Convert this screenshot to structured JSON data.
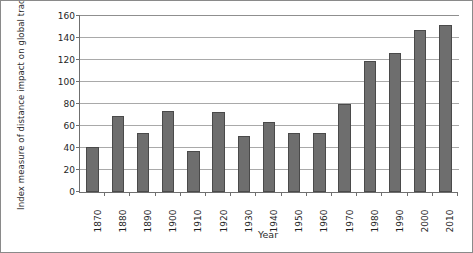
{
  "chart_data": {
    "type": "bar",
    "title": "",
    "xlabel": "Year",
    "ylabel": "Index measure of distance impact on global trade",
    "categories": [
      "1870",
      "1880",
      "1890",
      "1900",
      "1910",
      "1920",
      "1930",
      "1940",
      "1950",
      "1960",
      "1970",
      "1980",
      "1990",
      "2000",
      "2010"
    ],
    "values": [
      41,
      69,
      54,
      74,
      37,
      73,
      51,
      64,
      54,
      54,
      80,
      119,
      126,
      147,
      152
    ],
    "ylim": [
      0,
      160
    ],
    "ytick_labels": [
      "0",
      "20",
      "40",
      "60",
      "80",
      "100",
      "120",
      "140",
      "160"
    ],
    "ytick_values": [
      0,
      20,
      40,
      60,
      80,
      100,
      120,
      140,
      160
    ],
    "grid": true,
    "legend": "none",
    "series_color": "#6e6e6e",
    "series_edge_color": "#4a4a4a",
    "gridline_color": "#a9a9a9",
    "axis_color": "#6f6f6f"
  }
}
